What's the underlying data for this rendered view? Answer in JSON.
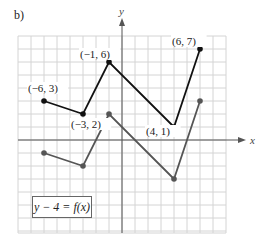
{
  "part_label": "b)",
  "equation": "y − 4 = f(x)",
  "colors": {
    "grid": "#d4d4d4",
    "axis": "#555555",
    "original": "#111111",
    "transformed": "#555555"
  },
  "chart_data": {
    "type": "line",
    "title": "b)",
    "xlabel": "x",
    "ylabel": "y",
    "xlim": [
      -8,
      8
    ],
    "ylim": [
      -7,
      8
    ],
    "grid": true,
    "annotations": [
      "(−6, 3)",
      "(−3, 2)",
      "(−1, 6)",
      "(4, 1)",
      "(6, 7)",
      "y − 4 = f(x)"
    ],
    "series": [
      {
        "name": "f(x) original (black)",
        "points": [
          [
            -6,
            3
          ],
          [
            -3,
            2
          ],
          [
            -1,
            6
          ],
          [
            4,
            1
          ],
          [
            6,
            7
          ]
        ],
        "labels": [
          "(−6, 3)",
          "(−3, 2)",
          "(−1, 6)",
          "(4, 1)",
          "(6, 7)"
        ]
      },
      {
        "name": "y − 4 = f(x) transformed (gray)",
        "points": [
          [
            -6,
            -1
          ],
          [
            -3,
            -2
          ],
          [
            -1,
            2
          ],
          [
            4,
            -3
          ],
          [
            6,
            3
          ]
        ]
      }
    ]
  }
}
